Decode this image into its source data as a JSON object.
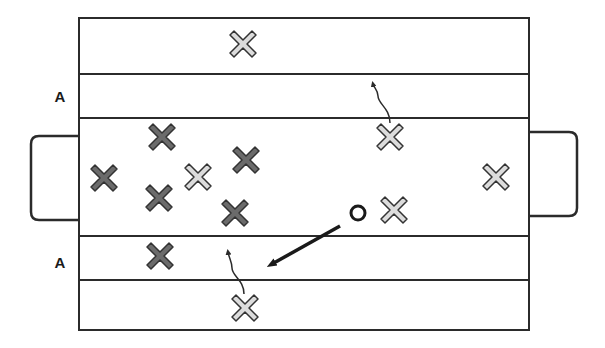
{
  "diagram": {
    "title": "",
    "colors": {
      "line": "#2b2b2b",
      "defender_fill": "#6b6b6b",
      "attacker_fill": "#dcdcdc",
      "marker_stroke": "#333333",
      "background": "#ffffff"
    },
    "field": {
      "x": 79,
      "y": 18,
      "width": 450,
      "height": 312
    },
    "horizontal_lines_y": [
      74,
      118,
      236,
      280
    ],
    "goals": [
      {
        "name": "left-goal",
        "x": 31,
        "y": 136,
        "width": 48,
        "height": 84,
        "side": "left"
      },
      {
        "name": "right-goal",
        "x": 529,
        "y": 132,
        "width": 48,
        "height": 84,
        "side": "right"
      }
    ],
    "zone_labels": [
      {
        "text": "A",
        "x": 50,
        "y": 89
      },
      {
        "text": "A",
        "x": 50,
        "y": 255
      }
    ],
    "defenders": [
      {
        "x": 104,
        "y": 178
      },
      {
        "x": 162,
        "y": 137
      },
      {
        "x": 246,
        "y": 160
      },
      {
        "x": 159,
        "y": 198
      },
      {
        "x": 235,
        "y": 213
      },
      {
        "x": 160,
        "y": 256
      }
    ],
    "attackers": [
      {
        "x": 243,
        "y": 44
      },
      {
        "x": 390,
        "y": 137
      },
      {
        "x": 198,
        "y": 177
      },
      {
        "x": 394,
        "y": 210
      },
      {
        "x": 496,
        "y": 177
      },
      {
        "x": 245,
        "y": 308
      }
    ],
    "ball": {
      "x": 358,
      "y": 213,
      "r": 7
    },
    "pass_arrow": {
      "x1": 340,
      "y1": 226,
      "x2": 272,
      "y2": 264
    },
    "run_arrows": [
      {
        "path": "M390 123 C 390 108, 378 104, 378 96 C 378 90, 374 88, 373 84"
      },
      {
        "path": "M244 294 C 244 280, 232 276, 232 268 C 232 262, 229 258, 228 252"
      }
    ]
  }
}
